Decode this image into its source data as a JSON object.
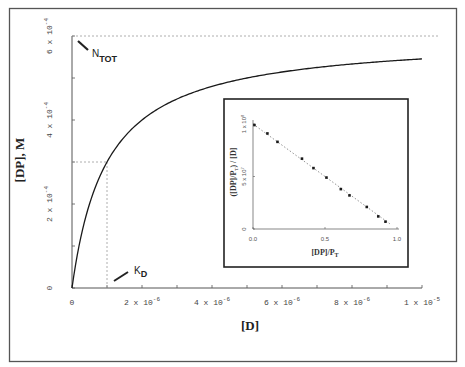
{
  "chart_data": [
    {
      "id": "main",
      "type": "line",
      "title": "",
      "xlabel": "[D]",
      "ylabel": "[DP], M",
      "xlim": [
        0,
        1e-05
      ],
      "ylim": [
        0,
        0.0006
      ],
      "grid": false,
      "x_ticks": [
        0,
        1e-06,
        2e-06,
        3e-06,
        4e-06,
        5e-06,
        6e-06,
        7e-06,
        8e-06,
        9e-06,
        1e-05
      ],
      "x_tick_labels": [
        {
          "value": 0,
          "base": "0",
          "exp": ""
        },
        {
          "value": 2e-06,
          "base": "2 x 10",
          "exp": "-6"
        },
        {
          "value": 4e-06,
          "base": "4 x 10",
          "exp": "-6"
        },
        {
          "value": 6e-06,
          "base": "6 x 10",
          "exp": "-6"
        },
        {
          "value": 8e-06,
          "base": "8 x 10",
          "exp": "-6"
        },
        {
          "value": 1e-05,
          "base": "1 x 10",
          "exp": "-5"
        }
      ],
      "y_ticks": [
        0,
        0.0001,
        0.0002,
        0.0003,
        0.0004,
        0.0005,
        0.0006
      ],
      "y_tick_labels": [
        {
          "value": 0,
          "base": "0",
          "exp": ""
        },
        {
          "value": 0.0002,
          "base": "2 x 10",
          "exp": "-4"
        },
        {
          "value": 0.0004,
          "base": "4 x 10",
          "exp": "-4"
        },
        {
          "value": 0.0006,
          "base": "6 x 10",
          "exp": "-4"
        }
      ],
      "series": [
        {
          "name": "binding curve",
          "model": "hyperbolic: [DP] = N_TOT*[D]/(K_D+[D])",
          "N_TOT": 0.0006,
          "K_D": 1e-06,
          "x": [
            0,
            2.5e-07,
            5e-07,
            1e-06,
            1.5e-06,
            2e-06,
            3e-06,
            4e-06,
            5e-06,
            6e-06,
            7e-06,
            8e-06,
            9e-06,
            1e-05
          ],
          "values": [
            0,
            0.00012,
            0.0002,
            0.0003,
            0.00036,
            0.0004,
            0.00045,
            0.00048,
            0.0005,
            0.000514,
            0.000525,
            0.000533,
            0.00054,
            0.000545
          ]
        }
      ],
      "annotations": [
        {
          "label": "N",
          "subscript": "TOT",
          "value": 0.0006,
          "kind": "horizontal dashed asymptote"
        },
        {
          "label": "K",
          "subscript": "D",
          "value": 1e-06,
          "kind": "vertical dashed line at half saturation (3e-4)"
        }
      ]
    },
    {
      "id": "inset",
      "type": "scatter",
      "title": "",
      "xlabel": "[DP]/P_T",
      "ylabel": "([DP]/P_T) / [D]",
      "xlim": [
        0,
        1.0
      ],
      "ylim": [
        0,
        100000000.0
      ],
      "x_tick_labels": [
        "0.0",
        "0.5",
        "1.0"
      ],
      "y_tick_labels": [
        {
          "value": 0,
          "base": "0",
          "exp": ""
        },
        {
          "value": 50000000.0,
          "base": "5 x 10",
          "exp": "7"
        },
        {
          "value": 100000000.0,
          "base": "1 x 10",
          "exp": "8"
        }
      ],
      "trendline": "dotted linear, slope -1/K_D",
      "x": [
        0.01,
        0.1,
        0.17,
        0.34,
        0.42,
        0.51,
        0.61,
        0.67,
        0.79,
        0.87,
        0.92
      ],
      "values": [
        99000000.0,
        91000000.0,
        83000000.0,
        67000000.0,
        58000000.0,
        49000000.0,
        38000000.0,
        32000000.0,
        21000000.0,
        12000000.0,
        7000000.0
      ]
    }
  ],
  "labels": {
    "main_xlabel": "[D]",
    "main_ylabel": "[DP], M",
    "ntot_main": "N",
    "ntot_sub": "TOT",
    "kd_main": "K",
    "kd_sub": "D",
    "inset_xlabel_main": "[DP]/P",
    "inset_xlabel_sub": "T",
    "inset_ylabel_pre": "([DP]/P",
    "inset_ylabel_sub": "T",
    "inset_ylabel_post": ") / [D]"
  },
  "colors": {
    "line": "#1a1a1a",
    "axis": "#555555",
    "dashed": "#999999",
    "frame": "#333333",
    "points": "#1a1a1a"
  }
}
